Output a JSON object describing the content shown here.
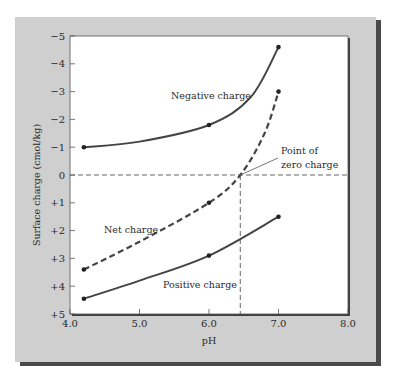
{
  "colors": {
    "panel": "#cfcfcf",
    "shadow": "#4a4a4a",
    "plot_bg": "#ffffff",
    "axis": "#444444",
    "line": "#444444",
    "text": "#2a2a2a"
  },
  "chart_data": {
    "type": "line",
    "title": "",
    "xlabel": "pH",
    "ylabel": "Surface charge (cmol/kg)",
    "xlim": [
      4.0,
      8.0
    ],
    "ylim": [
      5,
      -5
    ],
    "y_inverted": true,
    "grid": false,
    "legend": "none (inline labels)",
    "x_ticks": [
      "4.0",
      "5.0",
      "6.0",
      "7.0",
      "8.0"
    ],
    "y_ticks": [
      "-5",
      "-4",
      "-3",
      "-2",
      "-1",
      "0",
      "+1",
      "+2",
      "+3",
      "+4",
      "+5"
    ],
    "series": [
      {
        "name": "Negative charge",
        "style": "solid",
        "x": [
          4.2,
          6.0,
          7.0
        ],
        "values": [
          -1.0,
          -1.8,
          -4.6
        ]
      },
      {
        "name": "Net charge",
        "style": "dashed",
        "x": [
          4.2,
          6.0,
          6.45,
          7.0
        ],
        "values": [
          3.4,
          1.0,
          0.0,
          -3.0
        ]
      },
      {
        "name": "Positive charge",
        "style": "solid",
        "x": [
          4.2,
          6.0,
          7.0
        ],
        "values": [
          4.45,
          2.9,
          1.5
        ]
      }
    ],
    "annotations": [
      {
        "text_line1": "Point of",
        "text_line2": "zero charge",
        "x": 6.45,
        "y": 0.0
      }
    ],
    "reference_lines": [
      {
        "orientation": "horizontal",
        "value": 0,
        "style": "dashed"
      },
      {
        "orientation": "vertical",
        "value": 6.45,
        "style": "dashed"
      }
    ]
  },
  "labels": {
    "negative": "Negative charge",
    "net": "Net charge",
    "positive": "Positive charge",
    "pzc_line1": "Point of",
    "pzc_line2": "zero charge",
    "xlabel": "pH",
    "ylabel": "Surface charge (cmol/kg)",
    "x_ticks": [
      "4.0",
      "5.0",
      "6.0",
      "7.0",
      "8.0"
    ],
    "y_ticks": [
      "−5",
      "−4",
      "−3",
      "−2",
      "−1",
      "0",
      "+1",
      "+2",
      "+3",
      "+4",
      "+5"
    ]
  }
}
